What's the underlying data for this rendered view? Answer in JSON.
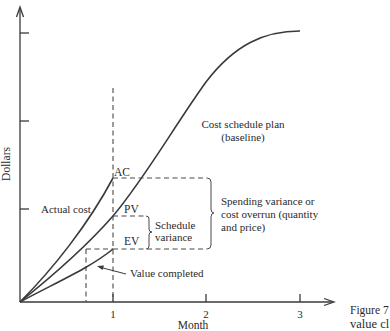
{
  "figure": {
    "caption_fragment_line1": "Figure 7",
    "caption_fragment_line2": "value cl",
    "y_axis_label": "Dollars",
    "x_axis_label": "Month",
    "x_ticks": [
      "1",
      "2",
      "3"
    ],
    "curves": {
      "plan_label_line1": "Cost schedule plan",
      "plan_label_line2": "(baseline)",
      "actual_label": "Actual cost",
      "earned_label": "Value completed"
    },
    "markers": {
      "ac": "AC",
      "pv": "PV",
      "ev": "EV"
    },
    "variances": {
      "schedule_line1": "Schedule",
      "schedule_line2": "variance",
      "spending_line1": "Spending variance or",
      "spending_line2": "cost overrun (quantity",
      "spending_line3": "and price)"
    }
  },
  "colors": {
    "line": "#3a3a3a",
    "text": "#2a2a2a",
    "background": "#ffffff"
  }
}
